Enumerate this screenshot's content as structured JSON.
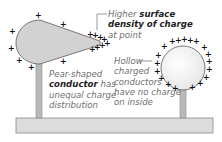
{
  "diagram": {
    "pear_conductor": {
      "label_parts": [
        {
          "text": "Pear-shaped",
          "bold": false
        },
        {
          "text": "conductor",
          "bold": true
        },
        {
          "text": " has",
          "bold": false
        },
        {
          "text": "unequal charge",
          "bold": false
        },
        {
          "text": "distribution",
          "bold": false
        }
      ],
      "line1": "Pear-shaped",
      "line2_bold": "conductor",
      "line2_rest": " has",
      "line3": "unequal charge",
      "line4": "distribution"
    },
    "point_annotation": {
      "line1_pre": "Higher ",
      "line1_bold": "surface",
      "line2_bold": "density of charge",
      "line3": "at point"
    },
    "hollow_sphere": {
      "line1": "Hollow",
      "line2": "charged",
      "line3": "conductors",
      "line4": "have no charge",
      "line5": "on inside"
    },
    "charge_symbol": "+",
    "colors": {
      "pear_fill": "#d2d2d2",
      "sphere_fill": "#f3f3f3",
      "stand_fill": "#b9b9b9",
      "base_fill": "#dcdcdc",
      "outline": "#6a6a6a",
      "text_grey": "#6f6f6f",
      "text_bold": "#222222"
    }
  }
}
